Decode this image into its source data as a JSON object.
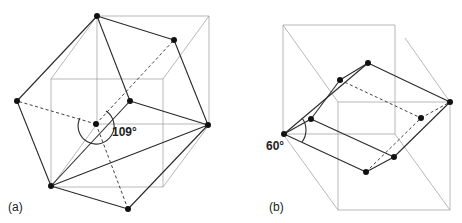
{
  "figure": {
    "panels": [
      {
        "id": "a",
        "label": "(a)",
        "angle_label": "109°",
        "description": "Rhombic dodecahedron-like polyhedron inscribed around a cube with tetrahedral angle marked"
      },
      {
        "id": "b",
        "label": "(b)",
        "angle_label": "60°",
        "description": "Rhombohedron inside a cube framework with 60° angle marked"
      }
    ]
  }
}
